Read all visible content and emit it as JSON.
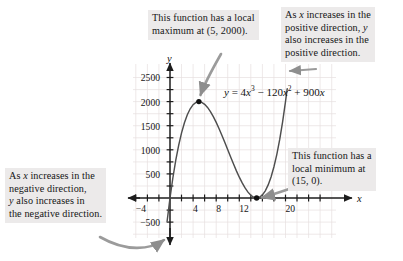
{
  "chart_data": {
    "type": "line",
    "title": "",
    "equation_text": "y = 4x³ − 120x² + 900x",
    "equation_parts": {
      "lhs": "y",
      "eq": "=",
      "t1_coef": "4",
      "t1_var": "x",
      "t1_exp": "3",
      "op1": "−",
      "t2_coef": "120",
      "t2_var": "x",
      "t2_exp": "2",
      "op2": "+",
      "t3_coef": "900",
      "t3_var": "x"
    },
    "xlabel": "x",
    "ylabel": "y",
    "xlim": [
      -6,
      23
    ],
    "ylim": [
      -800,
      2900
    ],
    "grid": true,
    "legend": "none",
    "x_ticks": [
      -4,
      4,
      8,
      12,
      20
    ],
    "x_tick_labels": [
      "−4",
      "4",
      "8",
      "12",
      "20"
    ],
    "x_minor_step": 2,
    "y_ticks": [
      -500,
      500,
      1000,
      1500,
      2000,
      2500
    ],
    "y_tick_labels": [
      "−500",
      "500",
      "1000",
      "1500",
      "2000",
      "2500"
    ],
    "points": [
      {
        "x": 5,
        "y": 2000,
        "label": "local maximum",
        "marker": "filled-dot"
      },
      {
        "x": 15,
        "y": 0,
        "label": "local minimum",
        "marker": "filled-dot"
      }
    ],
    "series": [
      {
        "name": "y = 4x^3 - 120x^2 + 900x",
        "x": [
          -2,
          -1.5,
          -1,
          -0.5,
          0,
          0.5,
          1,
          1.5,
          2,
          2.5,
          3,
          3.5,
          4,
          4.5,
          5,
          5.5,
          6,
          6.5,
          7,
          7.5,
          8,
          8.5,
          9,
          9.5,
          10,
          10.5,
          11,
          11.5,
          12,
          12.5,
          13,
          13.5,
          14,
          14.5,
          15,
          15.5,
          16,
          16.5,
          17,
          17.5,
          18,
          18.5,
          19,
          19.5,
          20,
          20.3
        ],
        "y": [
          -2312,
          -1633.5,
          -1024,
          -482.5,
          0,
          420.5,
          784,
          1093.5,
          1352,
          1562.5,
          1728,
          1851.5,
          1936,
          1984.5,
          2000,
          1985.5,
          1944,
          1878.5,
          1792,
          1687.5,
          1568,
          1436.5,
          1296,
          1149.5,
          1000,
          850.5,
          704,
          563.5,
          432,
          312.5,
          208,
          121.5,
          56,
          14.5,
          0,
          15.5,
          64,
          148.5,
          272,
          437.5,
          648,
          906.5,
          1216,
          1579.5,
          2000,
          2268.3
        ]
      }
    ],
    "colors": {
      "curve": "#4a4a4a",
      "axis": "#1d1d1d",
      "grid": "#e3dede",
      "point": "#111111",
      "callout_bg": "#eceaea",
      "text": "#151515",
      "arrow": "#8c8c8c"
    }
  },
  "callouts": {
    "local_max": {
      "name": "local-maximum-callout",
      "line1": "This function has a local",
      "line2_pre": "maximum at (5, 2000)."
    },
    "positive_direction": {
      "name": "positive-direction-callout",
      "line1_pre": "As ",
      "line1_it": "x",
      "line1_post": " increases in the",
      "line2_pre": "positive direction, ",
      "line2_it": "y",
      "line3": "also increases in the",
      "line4": "positive direction."
    },
    "negative_direction": {
      "name": "negative-direction-callout",
      "line1_pre": "As ",
      "line1_it": "x",
      "line1_post": " increases in the",
      "line2": "negative direction,",
      "line3_it": "y",
      "line3_post": " also increases in",
      "line4": "the negative direction."
    },
    "local_min": {
      "name": "local-minimum-callout",
      "line1": "This function has a",
      "line2": "local minimum at",
      "line3": "(15, 0)."
    }
  },
  "axis_labels": {
    "x": "x",
    "y": "y"
  },
  "y_tick_text": {
    "t2500": "2500",
    "t2000": "2000",
    "t1500": "1500",
    "t1000": "1000",
    "t500": "500",
    "tm500": "−500"
  },
  "x_tick_text": {
    "tm4": "−4",
    "t4": "4",
    "t8": "8",
    "t12": "12",
    "t20": "20"
  }
}
